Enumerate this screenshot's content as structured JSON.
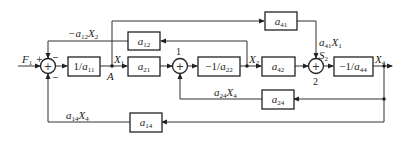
{
  "diagram": {
    "type": "block-diagram",
    "blocks": {
      "inv_a11": "1/a11",
      "a21": "a21",
      "a12": "a12",
      "neg_inv_a22": "−1/a22",
      "a42": "a42",
      "a41": "a41",
      "neg_inv_a44": "−1/a44",
      "a24": "a24",
      "a14": "a14"
    },
    "block_parts": {
      "inv_a11": {
        "pre": "1/",
        "sym": "a",
        "sub": "11"
      },
      "a21": {
        "pre": "",
        "sym": "a",
        "sub": "21"
      },
      "a12": {
        "pre": "",
        "sym": "a",
        "sub": "12"
      },
      "neg_inv_a22": {
        "pre": "−1/",
        "sym": "a",
        "sub": "22"
      },
      "a42": {
        "pre": "",
        "sym": "a",
        "sub": "42"
      },
      "a41": {
        "pre": "",
        "sym": "a",
        "sub": "41"
      },
      "neg_inv_a44": {
        "pre": "−1/",
        "sym": "a",
        "sub": "44"
      },
      "a24": {
        "pre": "",
        "sym": "a",
        "sub": "24"
      },
      "a14": {
        "pre": "",
        "sym": "a",
        "sub": "14"
      }
    },
    "signals": {
      "input": {
        "sym": "F",
        "sub": "1"
      },
      "x1": {
        "sym": "X",
        "sub": "1"
      },
      "x2": {
        "sym": "X",
        "sub": "2"
      },
      "x4": {
        "sym": "X",
        "sub": "4"
      },
      "s2": {
        "sym": "S",
        "sub": "2"
      },
      "node_a": "A",
      "fb_a12": {
        "pre": "−a",
        "sub": "12",
        "post": "X",
        "sub2": "2"
      },
      "ff_a41": {
        "pre": "a",
        "sub": "41",
        "post": "X",
        "sub2": "1"
      },
      "fb_a24": {
        "pre": "a",
        "sub": "24",
        "post": "X",
        "sub2": "4"
      },
      "fb_a14": {
        "pre": "a",
        "sub": "14",
        "post": "X",
        "sub2": "4"
      }
    },
    "summing_junctions": {
      "sum0": {
        "label": "",
        "signs": {
          "left": "+",
          "top": "−",
          "bottom": "−"
        }
      },
      "sum1": {
        "label": "1"
      },
      "sum2": {
        "label": "2"
      }
    },
    "sum_symbol": "+"
  }
}
